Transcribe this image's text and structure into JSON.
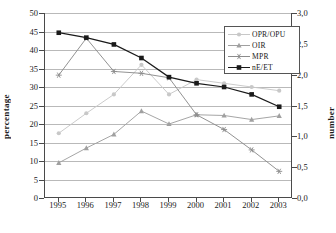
{
  "chart_data": {
    "type": "line",
    "title": "",
    "xlabel": "",
    "ylabel": "percentage",
    "y2label": "number",
    "categories": [
      "1995",
      "1996",
      "1997",
      "1998",
      "1999",
      "2000",
      "2001",
      "2002",
      "2003"
    ],
    "ylim": [
      0,
      50
    ],
    "y2lim": [
      0.0,
      3.0
    ],
    "yticks": [
      "0",
      "5",
      "10",
      "15",
      "20",
      "25",
      "30",
      "35",
      "40",
      "45",
      "50"
    ],
    "y2ticks": [
      "0,0",
      "0,5",
      "1,0",
      "1,5",
      "2,0",
      "2,5",
      "3,0"
    ],
    "grid": true,
    "legend_position": "top-right",
    "series": [
      {
        "name": "OPR/OPU",
        "axis": "left",
        "marker": "circle-plus",
        "color": "#c8c8c8",
        "values": [
          17.5,
          22.9,
          28.0,
          36.0,
          28.0,
          32.0,
          31.0,
          30.0,
          29.0
        ]
      },
      {
        "name": "OIR",
        "axis": "left",
        "marker": "triangle",
        "color": "#a0a0a0",
        "values": [
          9.5,
          13.5,
          17.2,
          23.5,
          20.0,
          22.5,
          22.3,
          21.2,
          22.2
        ]
      },
      {
        "name": "MPR",
        "axis": "left",
        "marker": "asterisk",
        "color": "#8c8c8c",
        "values": [
          33.2,
          43.2,
          34.2,
          33.7,
          32.5,
          22.5,
          18.5,
          13.0,
          7.2
        ]
      },
      {
        "name": "nE/ET",
        "axis": "right",
        "marker": "square",
        "color": "#1a1a1a",
        "values": [
          2.68,
          2.6,
          2.49,
          2.27,
          1.96,
          1.86,
          1.8,
          1.68,
          1.48
        ]
      }
    ]
  },
  "legend": {
    "items": [
      {
        "label": "OPR/OPU"
      },
      {
        "label": "OIR"
      },
      {
        "label": "MPR"
      },
      {
        "label": "nE/ET"
      }
    ]
  },
  "axes": {
    "left_title": "percentage",
    "right_title": "number"
  }
}
